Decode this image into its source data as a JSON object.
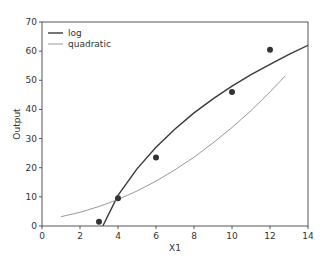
{
  "chart_data": {
    "type": "line",
    "title": "",
    "xlabel": "X1",
    "ylabel": "Output",
    "xlim": [
      0,
      14
    ],
    "ylim": [
      0,
      70
    ],
    "xticks": [
      0,
      2,
      4,
      6,
      8,
      10,
      12,
      14
    ],
    "yticks": [
      0,
      10,
      20,
      30,
      40,
      50,
      60,
      70
    ],
    "grid": false,
    "legend_position": "upper left",
    "series": [
      {
        "name": "log",
        "kind": "line",
        "color": "#3a3a3a",
        "x": [
          3.2,
          4,
          5,
          6,
          7,
          8,
          9,
          10,
          11,
          12,
          13,
          14
        ],
        "y": [
          0,
          10.5,
          19.6,
          27.0,
          33.3,
          38.8,
          43.6,
          48.0,
          51.9,
          55.5,
          58.9,
          62.0
        ]
      },
      {
        "name": "quadratic",
        "kind": "line",
        "color": "#999999",
        "x": [
          1,
          2,
          3,
          4,
          5,
          6,
          7,
          8,
          9,
          10,
          11,
          12,
          12.8
        ],
        "y": [
          3.2,
          4.7,
          6.7,
          9.1,
          12.0,
          15.4,
          19.3,
          23.6,
          28.5,
          33.8,
          39.6,
          46.0,
          51.5
        ]
      },
      {
        "name": "observed",
        "kind": "scatter",
        "color": "#333333",
        "x": [
          3,
          4,
          6,
          10,
          12
        ],
        "y": [
          1.5,
          9.5,
          23.5,
          46,
          60.5
        ]
      }
    ]
  }
}
